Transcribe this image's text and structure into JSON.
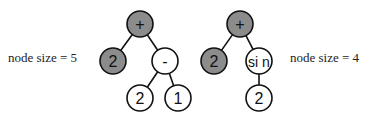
{
  "colors": {
    "shaded_fill": "#8c8c8c",
    "plain_fill": "#ffffff",
    "stroke": "#111111"
  },
  "trees": [
    {
      "label": "node size = 5",
      "label_pos": {
        "x": 8,
        "y": 62
      },
      "nodes": [
        {
          "id": "root",
          "text": "+",
          "x": 140,
          "y": 24,
          "shaded": true
        },
        {
          "id": "left",
          "text": "2",
          "x": 113,
          "y": 61,
          "shaded": true
        },
        {
          "id": "right",
          "text": "-",
          "x": 165,
          "y": 61,
          "shaded": false
        },
        {
          "id": "rl",
          "text": "2",
          "x": 140,
          "y": 98,
          "shaded": false
        },
        {
          "id": "rr",
          "text": "1",
          "x": 178,
          "y": 98,
          "shaded": false
        }
      ],
      "edges": [
        [
          "root",
          "left"
        ],
        [
          "root",
          "right"
        ],
        [
          "right",
          "rl"
        ],
        [
          "right",
          "rr"
        ]
      ]
    },
    {
      "label": "node size = 4",
      "label_pos": {
        "x": 290,
        "y": 62
      },
      "nodes": [
        {
          "id": "root",
          "text": "+",
          "x": 240,
          "y": 24,
          "shaded": true
        },
        {
          "id": "left",
          "text": "2",
          "x": 214,
          "y": 61,
          "shaded": true
        },
        {
          "id": "right",
          "text": "si n",
          "x": 259,
          "y": 61,
          "shaded": false
        },
        {
          "id": "rc",
          "text": "2",
          "x": 259,
          "y": 98,
          "shaded": false
        }
      ],
      "edges": [
        [
          "root",
          "left"
        ],
        [
          "root",
          "right"
        ],
        [
          "right",
          "rc"
        ]
      ]
    }
  ],
  "node_radius": 13
}
